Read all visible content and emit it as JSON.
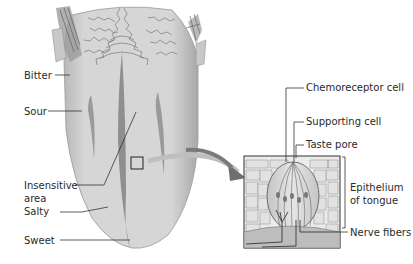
{
  "diagram": {
    "tongue_labels": [
      {
        "id": "bitter",
        "text": "Bitter"
      },
      {
        "id": "sour",
        "text": "Sour"
      },
      {
        "id": "insensitive",
        "text": "Insensitive area"
      },
      {
        "id": "salty",
        "text": "Salty"
      },
      {
        "id": "sweet",
        "text": "Sweet"
      }
    ],
    "insensitive_line1": "Insensitive",
    "insensitive_line2": "area",
    "taste_bud_labels": [
      {
        "id": "chemoreceptor",
        "text": "Chemoreceptor cell"
      },
      {
        "id": "supporting",
        "text": "Supporting cell"
      },
      {
        "id": "pore",
        "text": "Taste pore"
      },
      {
        "id": "epithelium",
        "text": "Epithelium of tongue"
      },
      {
        "id": "nerve",
        "text": "Nerve fibers"
      }
    ],
    "epithelium_line1": "Epithelium",
    "epithelium_line2": "of tongue",
    "colors": {
      "tongue_fill": "#d4d4d4",
      "groove": "#8f8f8f",
      "outline": "#3a3a3a",
      "arrow": "#6f6f6f",
      "background": "#ffffff"
    }
  }
}
